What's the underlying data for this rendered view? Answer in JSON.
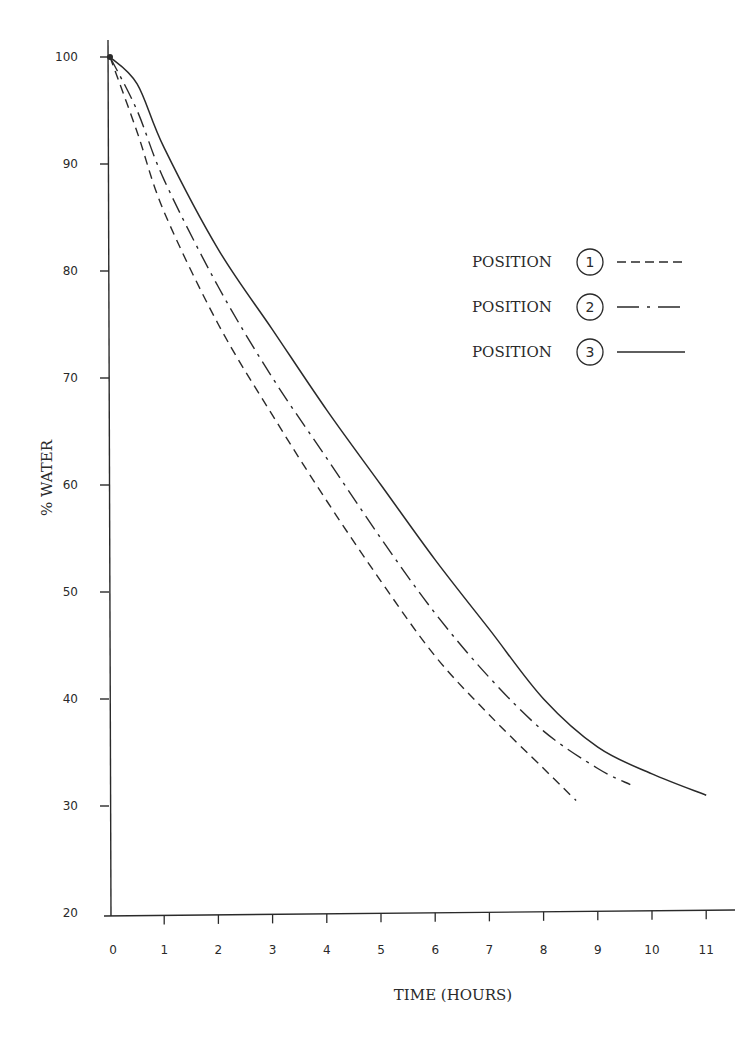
{
  "chart_data": {
    "type": "line",
    "title": "",
    "xlabel": "TIME (HOURS)",
    "ylabel": "% WATER",
    "xlim": [
      0,
      11
    ],
    "ylim": [
      20,
      100
    ],
    "x_ticks": [
      0,
      1,
      2,
      3,
      4,
      5,
      6,
      7,
      8,
      9,
      10,
      11
    ],
    "y_ticks": [
      20,
      30,
      40,
      50,
      60,
      70,
      80,
      90,
      100
    ],
    "grid": false,
    "legend_position": "upper right",
    "series": [
      {
        "name": "POSITION 1",
        "marker": "1",
        "style": "dashed",
        "x": [
          0,
          0.5,
          1,
          2,
          3,
          4,
          5,
          6,
          7,
          8,
          8.6
        ],
        "values": [
          100,
          93,
          85.5,
          75,
          66.5,
          58.5,
          51,
          44,
          38.5,
          33.5,
          30.5
        ]
      },
      {
        "name": "POSITION 2",
        "marker": "2",
        "style": "dash-dot",
        "x": [
          0,
          0.5,
          1,
          2,
          3,
          4,
          5,
          6,
          7,
          8,
          9,
          9.6
        ],
        "values": [
          100,
          95,
          88.5,
          78.5,
          70,
          62.5,
          55,
          48,
          42,
          37,
          33.5,
          32
        ]
      },
      {
        "name": "POSITION 3",
        "marker": "3",
        "style": "solid",
        "x": [
          0,
          0.5,
          1,
          2,
          3,
          4,
          5,
          6,
          7,
          8,
          9,
          10,
          11
        ],
        "values": [
          100,
          97.5,
          91.5,
          82,
          74.5,
          67,
          60,
          53,
          46.5,
          40,
          35.5,
          33,
          31
        ]
      }
    ]
  },
  "axes": {
    "x_title": "TIME (HOURS)",
    "y_title": "% WATER",
    "x_tick_labels": [
      "0",
      "1",
      "2",
      "3",
      "4",
      "5",
      "6",
      "7",
      "8",
      "9",
      "10",
      "11"
    ],
    "y_tick_labels": [
      "100",
      "90",
      "80",
      "70",
      "60",
      "50",
      "40",
      "30",
      "20"
    ]
  },
  "legend": {
    "items": [
      {
        "label": "POSITION",
        "number": "1",
        "style": "dashed"
      },
      {
        "label": "POSITION",
        "number": "2",
        "style": "dash-dot"
      },
      {
        "label": "POSITION",
        "number": "3",
        "style": "solid"
      }
    ]
  },
  "colors": {
    "ink": "#2a2a2a",
    "background": "#ffffff"
  }
}
